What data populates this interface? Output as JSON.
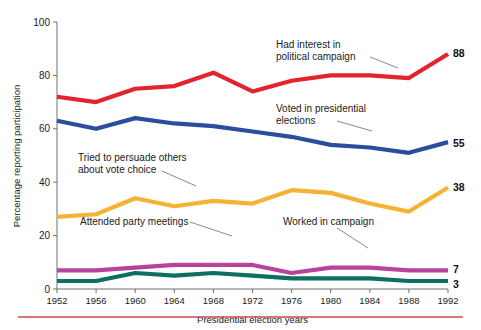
{
  "chart_data": {
    "type": "line",
    "title": "",
    "xlabel": "Presidential election years",
    "ylabel": "Percentage reporting participation",
    "categories": [
      "1952",
      "1956",
      "1960",
      "1964",
      "1968",
      "1972",
      "1976",
      "1980",
      "1984",
      "1988",
      "1992"
    ],
    "ylim": [
      0,
      100
    ],
    "ytick_labels": [
      "0",
      "20",
      "40",
      "60",
      "80",
      "100"
    ],
    "yticks": [
      0,
      20,
      40,
      60,
      80,
      100
    ],
    "grid": false,
    "legend": "inline-annotations",
    "series": [
      {
        "name": "Had interest in political campaign",
        "color": "#e2242c",
        "end_label": "88",
        "values": [
          72,
          70,
          75,
          76,
          81,
          74,
          78,
          80,
          80,
          79,
          88
        ]
      },
      {
        "name": "Voted in presidential elections",
        "color": "#2c4d9e",
        "end_label": "55",
        "values": [
          63,
          60,
          64,
          62,
          61,
          59,
          57,
          54,
          53,
          51,
          55
        ]
      },
      {
        "name": "Tried to persuade others about vote choice",
        "color": "#f4b335",
        "end_label": "38",
        "values": [
          27,
          28,
          34,
          31,
          33,
          32,
          37,
          36,
          32,
          29,
          38
        ]
      },
      {
        "name": "Attended party meetings",
        "color": "#b8439c",
        "end_label": "7",
        "values": [
          7,
          7,
          8,
          9,
          9,
          9,
          6,
          8,
          8,
          7,
          7
        ]
      },
      {
        "name": "Worked in campaign",
        "color": "#0d6f61",
        "end_label": "3",
        "values": [
          3,
          3,
          6,
          5,
          6,
          5,
          4,
          4,
          4,
          3,
          3
        ]
      }
    ],
    "annotations": [
      {
        "id": "interest",
        "text_line1": "Had interest in",
        "text_line2": "political campaign"
      },
      {
        "id": "voted",
        "text_line1": "Voted in presidential",
        "text_line2": "elections"
      },
      {
        "id": "persuade",
        "text_line1": "Tried to persuade others",
        "text_line2": "about vote choice"
      },
      {
        "id": "meetings",
        "text_line1": "Attended party meetings",
        "text_line2": ""
      },
      {
        "id": "worked",
        "text_line1": "Worked in campaign",
        "text_line2": ""
      }
    ],
    "footer_rule_color": "#c9484f"
  }
}
